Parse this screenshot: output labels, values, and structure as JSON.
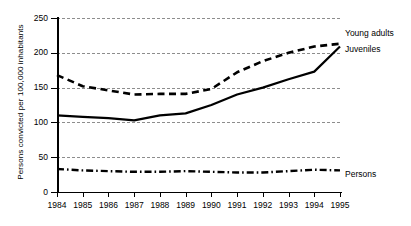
{
  "chart_data": {
    "type": "line",
    "title": "",
    "xlabel": "",
    "ylabel": "Persons convicted per 100,000 inhabitants",
    "categories": [
      "1984",
      "1985",
      "1986",
      "1987",
      "1988",
      "1989",
      "1990",
      "1991",
      "1992",
      "1993",
      "1994",
      "1995"
    ],
    "x": [
      1984,
      1985,
      1986,
      1987,
      1988,
      1989,
      1990,
      1991,
      1992,
      1993,
      1994,
      1995
    ],
    "xlim": [
      1984,
      1995
    ],
    "ylim": [
      0,
      250
    ],
    "yticks": [
      0,
      50,
      100,
      150,
      200,
      250
    ],
    "ytick_labels": [
      "0",
      "50",
      "100",
      "150",
      "200",
      "250"
    ],
    "grid": true,
    "grid_style": "dashed-horizontal",
    "legend": "inline-right-of-series",
    "series": [
      {
        "name": "Young adults",
        "style": "dashed",
        "color": "#000000",
        "values": [
          168,
          152,
          146,
          140,
          141,
          141,
          148,
          172,
          188,
          200,
          209,
          213
        ]
      },
      {
        "name": "Juveniles",
        "style": "solid",
        "color": "#000000",
        "values": [
          110,
          108,
          106,
          103,
          110,
          113,
          125,
          140,
          150,
          162,
          173,
          209
        ]
      },
      {
        "name": "Persons",
        "style": "dash-dot",
        "color": "#000000",
        "values": [
          33,
          31,
          30,
          29,
          29,
          30,
          29,
          28,
          28,
          30,
          32,
          31
        ]
      }
    ]
  },
  "axis": {
    "y_title": "Persons convicted per 100,000 inhabitants"
  },
  "labels": {
    "young_adults": "Young adults",
    "juveniles": "Juveniles",
    "persons": "Persons"
  }
}
